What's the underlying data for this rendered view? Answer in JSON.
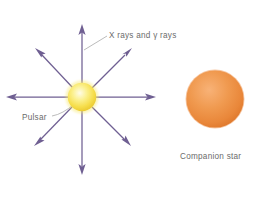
{
  "figure": {
    "background_color": "#ffffff",
    "width": 260,
    "height": 198
  },
  "labels": {
    "xrays": "X rays and γ rays",
    "pulsar": "Pulsar",
    "companion": "Companion star"
  },
  "objects": {
    "pulsar": {
      "name": "Pulsar",
      "shape": "sphere",
      "center_x": 82,
      "center_y": 97,
      "radius": 15,
      "color_core": "#fdfbe2",
      "color_mid": "#f7e14e",
      "color_edge": "#e8c92a"
    },
    "companion_star": {
      "name": "Companion star",
      "shape": "sphere",
      "center_x": 215,
      "center_y": 99,
      "radius": 29,
      "color_core": "#f6a862",
      "color_mid": "#ef8f44",
      "color_edge": "#e07a2c"
    }
  },
  "rays": {
    "name": "X rays and gamma rays",
    "color": "#6f5f92",
    "count": 8,
    "directions": [
      {
        "name": "up",
        "angle_deg": 270,
        "length": 73
      },
      {
        "name": "up-right",
        "angle_deg": 315,
        "length": 66
      },
      {
        "name": "right",
        "angle_deg": 0,
        "length": 74
      },
      {
        "name": "down-right",
        "angle_deg": 45,
        "length": 66
      },
      {
        "name": "down",
        "angle_deg": 90,
        "length": 78
      },
      {
        "name": "down-left",
        "angle_deg": 135,
        "length": 66
      },
      {
        "name": "left",
        "angle_deg": 180,
        "length": 77
      },
      {
        "name": "up-left",
        "angle_deg": 225,
        "length": 66
      }
    ]
  },
  "leader_lines": {
    "color": "#a8a8a8",
    "xrays": {
      "x1": 107,
      "y1": 36,
      "x2": 84,
      "y2": 50
    },
    "pulsar": {
      "x1": 52,
      "y1": 115,
      "x2": 73,
      "y2": 104
    }
  }
}
